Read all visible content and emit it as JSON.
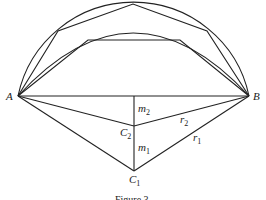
{
  "diagram": {
    "type": "geometry",
    "points": {
      "A": {
        "label": "A",
        "x": 18,
        "y": 96
      },
      "B": {
        "label": "B",
        "x": 249,
        "y": 96
      },
      "C1": {
        "label": "C",
        "sub": "1",
        "x": 134,
        "y": 171
      },
      "C2": {
        "label": "C",
        "sub": "2",
        "x": 134,
        "y": 126
      },
      "M": {
        "x": 134,
        "y": 96
      }
    },
    "segment_labels": {
      "m2": {
        "label": "m",
        "sub": "2"
      },
      "m1": {
        "label": "m",
        "sub": "1"
      },
      "r2": {
        "label": "r",
        "sub": "2"
      },
      "r1": {
        "label": "r",
        "sub": "1"
      }
    },
    "outer_polygon": [
      [
        18,
        96
      ],
      [
        58,
        31
      ],
      [
        133,
        4
      ],
      [
        207,
        31
      ],
      [
        249,
        96
      ]
    ],
    "inner_polygon": [
      [
        18,
        96
      ],
      [
        88,
        40
      ],
      [
        180,
        40
      ],
      [
        249,
        96
      ]
    ],
    "caption": "Figure 3"
  }
}
